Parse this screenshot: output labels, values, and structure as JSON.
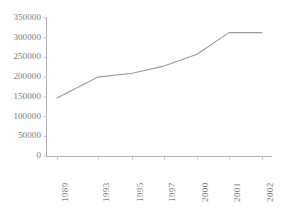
{
  "chart_data": {
    "type": "line",
    "title": "",
    "subtitle": "",
    "xlabel": "",
    "ylabel": "",
    "categories": [
      "1989",
      "1993",
      "1995",
      "1997",
      "2000",
      "2001",
      "2002"
    ],
    "values": [
      147000,
      200000,
      210000,
      228000,
      258000,
      313000,
      313000
    ],
    "series": [
      {
        "name": "",
        "values": [
          147000,
          200000,
          210000,
          228000,
          258000,
          313000,
          313000
        ]
      }
    ],
    "ylim": [
      0,
      350000
    ],
    "yticks": [
      0,
      50000,
      100000,
      150000,
      200000,
      250000,
      300000,
      350000
    ],
    "ytick_labels": [
      "0",
      "50000",
      "100000",
      "150000",
      "200000",
      "250000",
      "300000",
      "350000"
    ],
    "xtick_labels": [
      "1989",
      "1993",
      "1995",
      "1997",
      "2000",
      "2001",
      "2002"
    ],
    "grid": false,
    "legend": false,
    "legend_position": "none",
    "line_color": "#9a9a9a",
    "axis_color": "#b0b0b0",
    "text_color": "#7b7b7b",
    "background_color": "#ffffff",
    "xtick_rotation": -90
  },
  "axes": {
    "y_axis_name": "value-axis",
    "x_axis_name": "year-axis"
  }
}
